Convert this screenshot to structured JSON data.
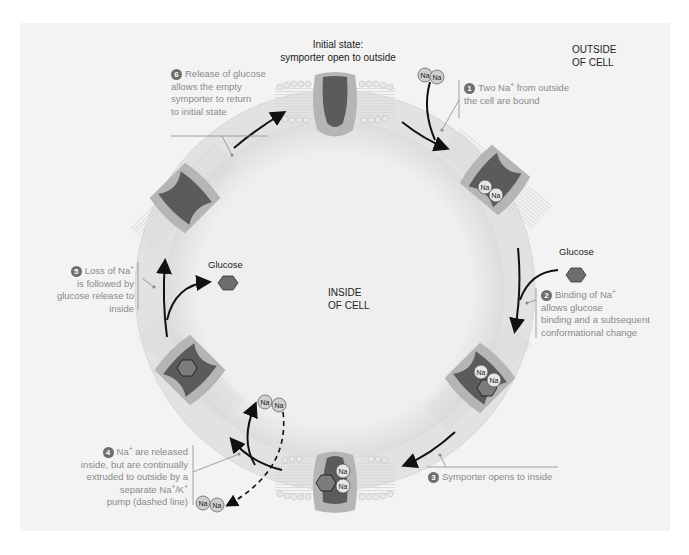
{
  "regions": {
    "outside": [
      "OUTSIDE",
      "OF CELL"
    ],
    "inside": [
      "INSIDE",
      "OF CELL"
    ]
  },
  "initial_state": {
    "title": "Initial state:",
    "subtitle": "symporter open to outside"
  },
  "molecules": {
    "sodium": "Na",
    "sodium_charge": "+",
    "glucose": "Glucose",
    "glucose_oxygen": "O"
  },
  "steps": [
    {
      "number": "1",
      "lines": [
        "Two Na",
        "+",
        " from outside",
        "the cell are bound"
      ]
    },
    {
      "number": "2",
      "lines": [
        "Binding of Na",
        "+",
        "allows glucose",
        "binding and a subsequent",
        "conformational change"
      ]
    },
    {
      "number": "3",
      "lines": [
        "Symporter opens to inside"
      ]
    },
    {
      "number": "4",
      "lines": [
        "Na",
        "+",
        " are released",
        "inside, but are continually",
        "extruded to outside by a",
        "separate Na",
        "+",
        "/K",
        "+",
        "pump (dashed line)"
      ]
    },
    {
      "number": "5",
      "lines": [
        "Loss of Na",
        "+",
        "is followed by",
        "glucose release to",
        "inside"
      ]
    },
    {
      "number": "6",
      "lines": [
        "Release of glucose",
        "allows the empty",
        "symporter to return",
        "to initial state"
      ]
    }
  ],
  "colors": {
    "background": "#f3f3f3",
    "cell_interior": "#ebebeb",
    "protein_light": "#b8b8b8",
    "protein_dark": "#5a5a5a",
    "arrow": "#111111",
    "label_text": "#8a8a8a",
    "number_badge": "#6e6e6e"
  }
}
